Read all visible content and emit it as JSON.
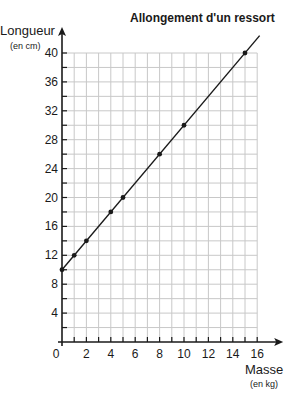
{
  "chart_data": {
    "type": "line",
    "title": "Allongement d'un ressort",
    "ylabel": "Longueur",
    "yunit": "(en cm)",
    "xlabel": "Masse",
    "xunit": "(en kg)",
    "xlim": [
      0,
      16
    ],
    "ylim": [
      0,
      40
    ],
    "x_ticks": [
      0,
      2,
      4,
      6,
      8,
      10,
      12,
      14,
      16
    ],
    "y_ticks": [
      4,
      8,
      12,
      16,
      20,
      24,
      28,
      32,
      36,
      40
    ],
    "grid": true,
    "grid_step_x": 1,
    "grid_step_y": 2,
    "series": [
      {
        "name": "Longueur du ressort",
        "points": [
          [
            0,
            10
          ],
          [
            1,
            12
          ],
          [
            2,
            14
          ],
          [
            4,
            18
          ],
          [
            5,
            20
          ],
          [
            8,
            26
          ],
          [
            10,
            30
          ],
          [
            15,
            40
          ]
        ],
        "fit_line": {
          "slope": 2,
          "intercept": 10,
          "x_range": [
            0,
            16.2
          ]
        }
      }
    ],
    "colors": {
      "line": "#1a1a1a",
      "grid": "#c8c8c8",
      "axis": "#1a1a1a"
    }
  }
}
